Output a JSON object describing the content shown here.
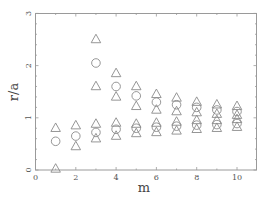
{
  "chart_data": {
    "type": "scatter",
    "title": "",
    "xlabel": "m",
    "ylabel": "r/a",
    "xlim": [
      0,
      10.7
    ],
    "ylim": [
      0,
      3
    ],
    "xticks": [
      0,
      2,
      4,
      6,
      8,
      10
    ],
    "yticks": [
      0,
      1,
      2,
      3
    ],
    "grid": false,
    "legend": null,
    "series": [
      {
        "name": "triangles",
        "marker": "triangle",
        "points": [
          [
            1,
            0.8
          ],
          [
            1,
            0.02
          ],
          [
            2,
            0.85
          ],
          [
            2,
            0.45
          ],
          [
            3,
            2.5
          ],
          [
            3,
            1.6
          ],
          [
            3,
            0.88
          ],
          [
            3,
            0.6
          ],
          [
            4,
            1.85
          ],
          [
            4,
            1.4
          ],
          [
            4,
            0.9
          ],
          [
            4,
            0.65
          ],
          [
            5,
            1.6
          ],
          [
            5,
            1.22
          ],
          [
            5,
            0.88
          ],
          [
            5,
            0.7
          ],
          [
            6,
            1.45
          ],
          [
            6,
            1.15
          ],
          [
            6,
            0.9
          ],
          [
            6,
            0.72
          ],
          [
            7,
            1.38
          ],
          [
            7,
            1.12
          ],
          [
            7,
            0.92
          ],
          [
            7,
            0.75
          ],
          [
            8,
            1.3
          ],
          [
            8,
            1.1
          ],
          [
            8,
            0.95
          ],
          [
            8,
            0.78
          ],
          [
            9,
            1.25
          ],
          [
            9,
            1.07
          ],
          [
            9,
            0.95
          ],
          [
            9,
            0.8
          ],
          [
            10,
            1.22
          ],
          [
            10,
            1.05
          ],
          [
            10,
            0.97
          ],
          [
            10,
            0.82
          ]
        ]
      },
      {
        "name": "circles",
        "marker": "circle",
        "points": [
          [
            1,
            0.55
          ],
          [
            2,
            0.65
          ],
          [
            3,
            2.05
          ],
          [
            3,
            0.72
          ],
          [
            4,
            1.6
          ],
          [
            4,
            0.78
          ],
          [
            5,
            1.42
          ],
          [
            5,
            0.8
          ],
          [
            6,
            1.3
          ],
          [
            6,
            0.82
          ],
          [
            7,
            1.25
          ],
          [
            7,
            0.84
          ],
          [
            8,
            1.2
          ],
          [
            8,
            0.86
          ],
          [
            9,
            1.15
          ],
          [
            9,
            0.87
          ],
          [
            10,
            1.12
          ],
          [
            10,
            0.89
          ]
        ]
      }
    ]
  },
  "labels": {
    "xlabel": "m",
    "ylabel": "r/a"
  },
  "colors": {
    "frame": "#9a9a9a",
    "marker": "#8a8a8a",
    "text": "#555555"
  }
}
